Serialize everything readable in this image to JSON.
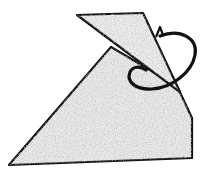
{
  "figure": {
    "colors": {
      "background": "#ffffff",
      "fill": "#e9e9e9",
      "stroke": "#111111",
      "speckle": "#b5b5b5"
    }
  }
}
